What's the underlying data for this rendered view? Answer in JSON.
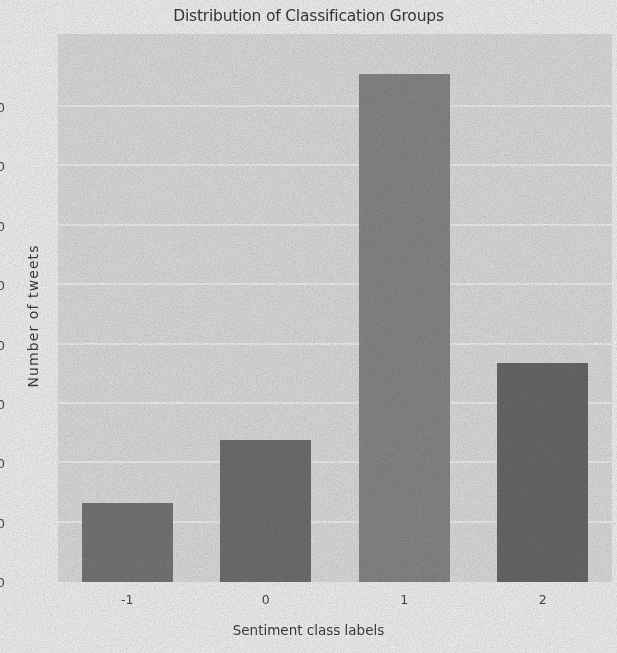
{
  "chart_data": {
    "type": "bar",
    "title": "Distribution of Classification Groups",
    "xlabel": "Sentiment class labels",
    "ylabel": "Number of tweets",
    "categories": [
      "-1",
      "0",
      "1",
      "2"
    ],
    "values": [
      1330,
      2390,
      8550,
      3690
    ],
    "bar_colors": [
      "#7b7b7b",
      "#757575",
      "#8d8d8d",
      "#6d6d6d"
    ],
    "ylim": [
      0,
      9230
    ],
    "yticks": [
      0,
      1000,
      2000,
      3000,
      4000,
      5000,
      6000,
      7000,
      8000
    ],
    "ytick_labels": [
      "0",
      "1000",
      "2000",
      "3000",
      "4000",
      "5000",
      "6000",
      "7000",
      "8000"
    ],
    "grid": true,
    "grid_axis": "y",
    "grid_color": "#fbfbfb",
    "panel_color": "#e7e7e7",
    "legend": null,
    "legend_position": "none"
  },
  "figure": {
    "background_color": "#fdfdfd",
    "text_color": "#3f3f3f"
  }
}
